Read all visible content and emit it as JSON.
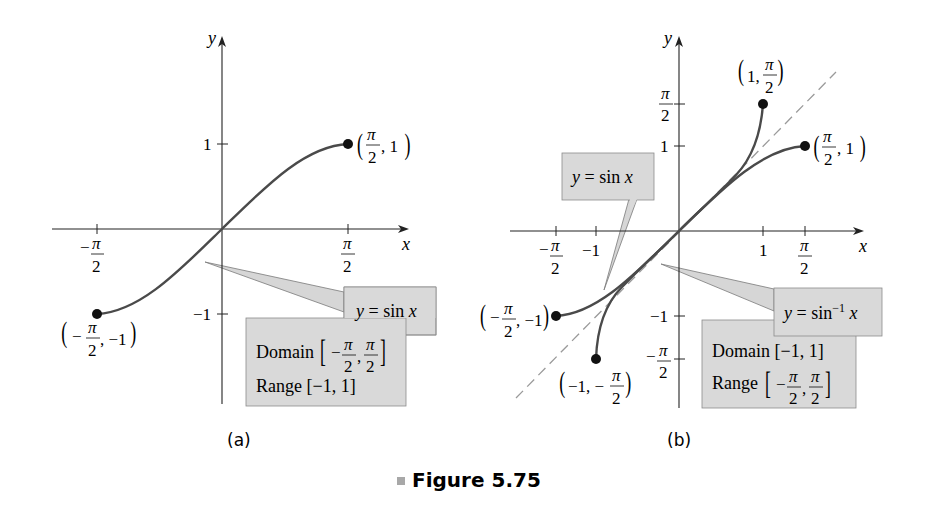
{
  "figure": {
    "caption_marker_color": "#a8a8a8",
    "caption": "Figure 5.75",
    "panel_a_label": "(a)",
    "panel_b_label": "(b)"
  },
  "panel_a": {
    "axis_x": "x",
    "axis_y": "y",
    "tick_x_neg": {
      "sign": "−",
      "num": "π",
      "den": "2"
    },
    "tick_x_pos": {
      "num": "π",
      "den": "2"
    },
    "tick_y_pos": "1",
    "tick_y_neg": "−1",
    "point_end": {
      "open": "(",
      "num": "π",
      "den": "2",
      "rest": ", 1",
      "close": ")"
    },
    "point_start": {
      "open": "(",
      "sign": "−",
      "num": "π",
      "den": "2",
      "rest": ", −1",
      "close": ")"
    },
    "callout": {
      "y": "y",
      "eq": " = sin ",
      "x": "x"
    },
    "info_box": {
      "domain_label": "Domain",
      "domain_sign": "−",
      "domain_num": "π",
      "domain_den": "2",
      "range_text": "Range [−1, 1]"
    }
  },
  "panel_b": {
    "axis_x": "x",
    "axis_y": "y",
    "tick_x_neg_pi2": {
      "sign": "−",
      "num": "π",
      "den": "2"
    },
    "tick_x_neg1": "−1",
    "tick_x_pos1": "1",
    "tick_x_pos_pi2": {
      "num": "π",
      "den": "2"
    },
    "tick_y_pi2": {
      "num": "π",
      "den": "2"
    },
    "tick_y_1": "1",
    "tick_y_neg1": "−1",
    "tick_y_neg_pi2": {
      "sign": "−",
      "num": "π",
      "den": "2"
    },
    "point_asin_end": {
      "pre": "1, ",
      "num": "π",
      "den": "2"
    },
    "point_sin_end": {
      "num": "π",
      "den": "2",
      "rest": ", 1"
    },
    "point_sin_start": {
      "sign": "−",
      "num": "π",
      "den": "2",
      "rest": ", −1"
    },
    "point_asin_start": {
      "pre": "−1, −",
      "num": "π",
      "den": "2"
    },
    "callout_sin": {
      "y": "y",
      "eq": " = sin ",
      "x": "x"
    },
    "callout_asin": {
      "y": "y",
      "eq": " = sin",
      "sup": "−1",
      "x": " x"
    },
    "info_box": {
      "domain_text": "Domain [−1, 1]",
      "range_label": "Range",
      "range_sign": "−",
      "range_num": "π",
      "range_den": "2"
    }
  },
  "colors": {
    "curve": "#4a4a4a",
    "axis": "#222222",
    "callout_fill": "#d9d9d9",
    "callout_shadow": "#8c8c8c",
    "dashed": "#9a9a9a"
  }
}
